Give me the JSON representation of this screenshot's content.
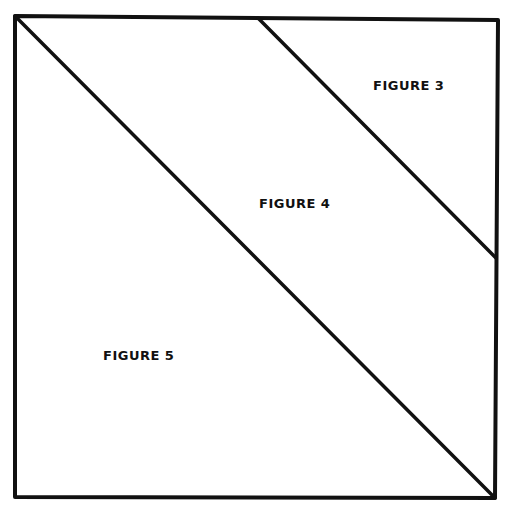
{
  "diagram": {
    "stroke_color": "#111111",
    "background": "#ffffff",
    "labels": [
      {
        "id": "figure-3",
        "text": "FIGURE 3",
        "x": 373,
        "y": 78
      },
      {
        "id": "figure-4",
        "text": "FIGURE 4",
        "x": 259,
        "y": 196
      },
      {
        "id": "figure-5",
        "text": "FIGURE 5",
        "x": 103,
        "y": 348
      }
    ]
  }
}
